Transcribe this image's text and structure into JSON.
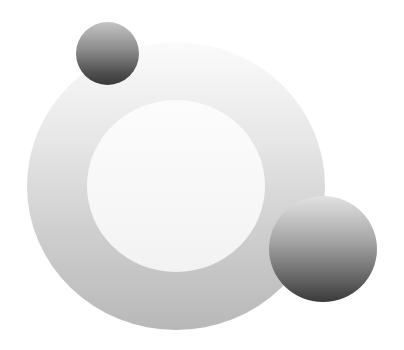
{
  "graphic": {
    "description": "Abstract logo-like graphic: large gray gradient ring with white center, two shaded gray spheres",
    "colors": {
      "background": "#ffffff",
      "ring_top": "#fbfbfb",
      "ring_bottom": "#b8b8b8",
      "inner_disc": "#f7f7f7",
      "sphere_light": "#c4c4c4",
      "sphere_dark": "#383838"
    },
    "shapes": [
      {
        "name": "outer-ring",
        "cx": 176,
        "cy": 186,
        "r": 148
      },
      {
        "name": "inner-disc",
        "cx": 176,
        "cy": 186,
        "r": 88
      },
      {
        "name": "small-sphere",
        "cx": 107,
        "cy": 53,
        "r": 31
      },
      {
        "name": "large-sphere",
        "cx": 323,
        "cy": 249,
        "r": 53
      }
    ]
  }
}
